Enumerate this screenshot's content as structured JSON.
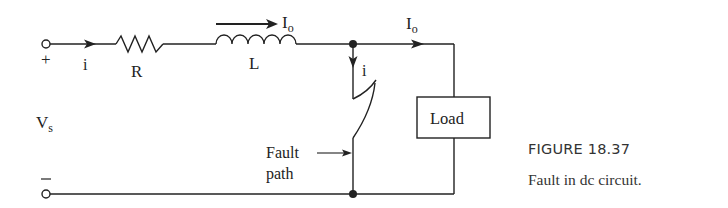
{
  "figure": {
    "number": "FIGURE 18.37",
    "caption": "Fault in dc circuit."
  },
  "labels": {
    "plus": "+",
    "minus": "−",
    "source_current": "i",
    "resistor": "R",
    "inductor": "L",
    "inductor_current": "I",
    "inductor_current_sub": "o",
    "load_current": "I",
    "load_current_sub": "o",
    "fault_current": "i",
    "source_voltage": "V",
    "source_voltage_sub": "s",
    "load": "Load",
    "fault_line1": "Fault",
    "fault_line2": "path"
  },
  "colors": {
    "stroke": "#222222",
    "text": "#333333"
  }
}
